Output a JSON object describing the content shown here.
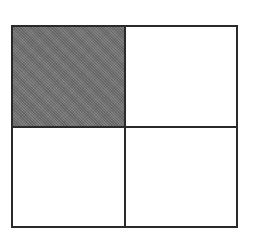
{
  "diagram": {
    "type": "grid",
    "rows": 2,
    "cols": 2,
    "cells": [
      {
        "row": 0,
        "col": 0,
        "shaded": true
      },
      {
        "row": 0,
        "col": 1,
        "shaded": false
      },
      {
        "row": 1,
        "col": 0,
        "shaded": false
      },
      {
        "row": 1,
        "col": 1,
        "shaded": false
      }
    ],
    "colors": {
      "border": "#2a2a2a",
      "shade": "#7a7a7a",
      "background": "#ffffff"
    }
  }
}
